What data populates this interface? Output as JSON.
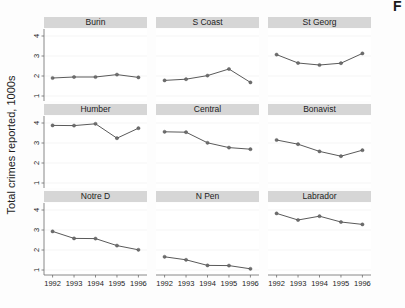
{
  "corner": {
    "partial_letter": "F"
  },
  "chart_data": {
    "type": "line",
    "title": "",
    "subtitle": "",
    "xlabel": "",
    "ylabel": "Total crimes reported, 1000s",
    "x": [
      1992,
      1993,
      1994,
      1995,
      1996
    ],
    "xtick_labels": [
      "1992",
      "1993",
      "1994",
      "1995",
      "1996"
    ],
    "ytick_labels": [
      "1",
      "2",
      "3",
      "4"
    ],
    "ytick_values": [
      1,
      2,
      3,
      4
    ],
    "xlim": [
      1991.6,
      1996.4
    ],
    "ylim": [
      0.75,
      4.35
    ],
    "grid": true,
    "legend": "none",
    "layout": {
      "rows": 3,
      "cols": 3,
      "type": "small-multiples"
    },
    "marker": "filled-circle",
    "line_color": "#5a5a5a",
    "marker_color": "#6e6e6e",
    "strip_color": "#d6d6d6",
    "panels": [
      {
        "name": "Burin",
        "row": 0,
        "col": 0,
        "values": [
          1.9,
          1.95,
          1.95,
          2.07,
          1.93
        ]
      },
      {
        "name": "S Coast",
        "row": 0,
        "col": 1,
        "values": [
          1.78,
          1.84,
          2.02,
          2.35,
          1.68
        ]
      },
      {
        "name": "St Georg",
        "row": 0,
        "col": 2,
        "values": [
          3.07,
          2.65,
          2.55,
          2.64,
          3.13
        ]
      },
      {
        "name": "Humber",
        "row": 1,
        "col": 0,
        "values": [
          3.88,
          3.87,
          3.96,
          3.24,
          3.74
        ]
      },
      {
        "name": "Central",
        "row": 1,
        "col": 1,
        "values": [
          3.56,
          3.54,
          3.01,
          2.77,
          2.69
        ]
      },
      {
        "name": "Bonavist",
        "row": 1,
        "col": 2,
        "values": [
          3.15,
          2.94,
          2.58,
          2.34,
          2.64
        ]
      },
      {
        "name": "Notre D",
        "row": 2,
        "col": 0,
        "values": [
          2.93,
          2.58,
          2.57,
          2.22,
          2.01
        ]
      },
      {
        "name": "N Pen",
        "row": 2,
        "col": 1,
        "values": [
          1.66,
          1.51,
          1.23,
          1.22,
          1.06
        ]
      },
      {
        "name": "Labrador",
        "row": 2,
        "col": 2,
        "values": [
          3.83,
          3.5,
          3.69,
          3.4,
          3.28
        ]
      }
    ]
  }
}
